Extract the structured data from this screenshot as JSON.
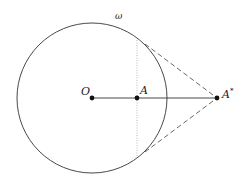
{
  "diagram": {
    "type": "geometry",
    "circle": {
      "label": "ω",
      "cx": 92,
      "cy": 98,
      "r": 75
    },
    "points": [
      {
        "id": "O",
        "label": "O",
        "x": 92,
        "y": 98
      },
      {
        "id": "A",
        "label": "A",
        "x": 137,
        "y": 98
      },
      {
        "id": "Astar",
        "label": "A*",
        "x": 217,
        "y": 98
      }
    ],
    "tangent_points": [
      {
        "x": 145,
        "y": 44
      },
      {
        "x": 145,
        "y": 152
      }
    ],
    "labels": {
      "omega": "ω",
      "O": "O",
      "A": "A",
      "A_star_base": "A",
      "A_star_sup": "*"
    },
    "colors": {
      "stroke": "#333333",
      "dashed": "#555555",
      "dotted": "#aaaaaa",
      "point": "#111111"
    }
  }
}
